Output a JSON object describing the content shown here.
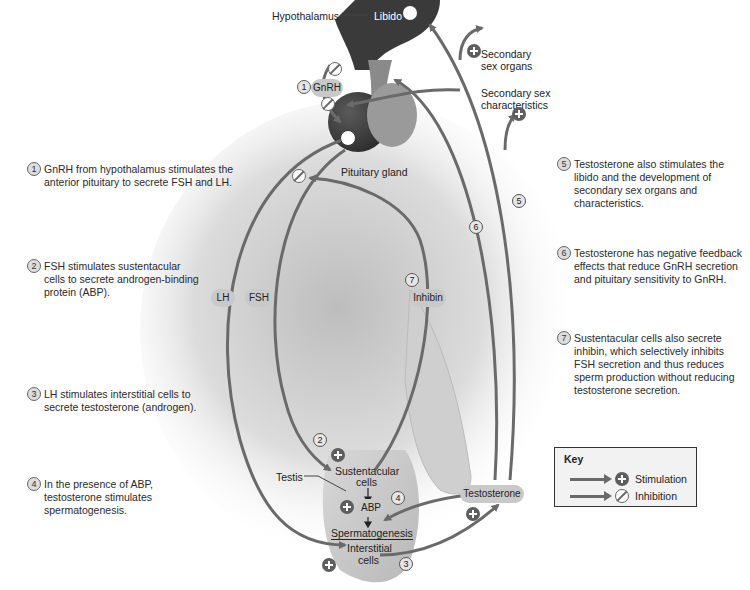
{
  "figure": {
    "caption_fragment": "FIGURE 27.??",
    "colors": {
      "arrow": "#6a6a6a",
      "pill": "#c9c9c9",
      "brain": "#3a3a3a",
      "pituitary": "#7a7a7a"
    }
  },
  "notes_left": [
    {
      "num": "1",
      "text": "GnRH from hypothalamus stimulates the anterior pituitary to secrete FSH and LH."
    },
    {
      "num": "2",
      "text": "FSH stimulates sustentacular cells to secrete androgen-binding protein (ABP)."
    },
    {
      "num": "3",
      "text": "LH stimulates interstitial cells to secrete testosterone (androgen)."
    },
    {
      "num": "4",
      "text": "In the presence of ABP, testosterone stimulates spermatogenesis."
    }
  ],
  "notes_right": [
    {
      "num": "5",
      "text": "Testosterone also stimulates the libido and the development of secondary sex organs and characteristics."
    },
    {
      "num": "6",
      "text": "Testosterone has negative feedback effects that reduce GnRH secretion and pituitary sensitivity to GnRH."
    },
    {
      "num": "7",
      "text": "Sustentacular cells also secrete inhibin, which selectively inhibits FSH secretion and thus reduces sperm production without reducing testosterone secretion."
    }
  ],
  "diagram": {
    "hypothalamus": "Hypothalamus",
    "libido": "Libido",
    "secondary_sex_organs": "Secondary sex organs",
    "secondary_sex_organs_l1": "Secondary",
    "secondary_sex_organs_l2": "sex organs",
    "secondary_sex_characteristics_l1": "Secondary sex",
    "secondary_sex_characteristics_l2": "characteristics",
    "gnrh": "GnRH",
    "pituitary_gland": "Pituitary gland",
    "lh": "LH",
    "fsh": "FSH",
    "inhibin": "Inhibin",
    "testis": "Testis",
    "sustentacular_l1": "Sustentacular",
    "sustentacular_l2": "cells",
    "abp": "ABP",
    "spermatogenesis": "Spermatogenesis",
    "interstitial_l1": "Interstitial",
    "interstitial_l2": "cells",
    "testosterone": "Testosterone",
    "step_markers": [
      "1",
      "2",
      "3",
      "4",
      "5",
      "6",
      "7"
    ]
  },
  "key": {
    "title": "Key",
    "stimulation": "Stimulation",
    "inhibition": "Inhibition"
  }
}
